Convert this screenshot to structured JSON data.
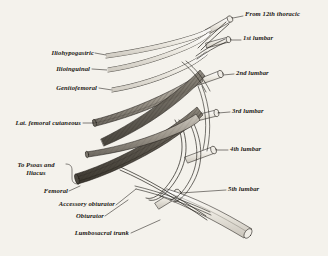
{
  "figure": {
    "background_color": "#f4f2ec",
    "ink_color": "#1a1712",
    "shade_light": "#e9e6de",
    "shade_mid": "#b3aea4",
    "shade_dark": "#6d6860"
  },
  "labels_right": [
    {
      "id": "from-12th-thoracic",
      "text": "From 12th thoracic"
    },
    {
      "id": "1st-lumbar",
      "text": "1st lumbar"
    },
    {
      "id": "2nd-lumbar",
      "text": "2nd lumbar"
    },
    {
      "id": "3rd-lumbar",
      "text": "3rd lumbar"
    },
    {
      "id": "4th-lumbar",
      "text": "4th lumbar"
    },
    {
      "id": "5th-lumbar",
      "text": "5th lumbar"
    }
  ],
  "labels_left": [
    {
      "id": "iliohypogastric",
      "text": "Iliohypogastric"
    },
    {
      "id": "ilioinguinal",
      "text": "Ilioinguinal"
    },
    {
      "id": "genitofemoral",
      "text": "Genitofemoral"
    },
    {
      "id": "lat-femoral-cutaneous",
      "text": "Lat. femoral cutaneous"
    },
    {
      "id": "to-psoas-and-iliacus",
      "text": "To Psoas and Iliacus"
    },
    {
      "id": "femoral",
      "text": "Femoral"
    },
    {
      "id": "accessory-obturator",
      "text": "Accessory obturator"
    },
    {
      "id": "obturator",
      "text": "Obturator"
    },
    {
      "id": "lumbosacral-trunk",
      "text": "Lumbosacral trunk"
    }
  ]
}
